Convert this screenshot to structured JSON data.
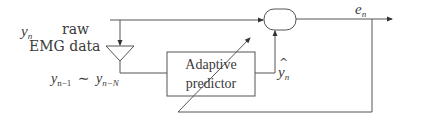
{
  "diagram": {
    "type": "block-diagram",
    "input": {
      "symbol": "y",
      "subscript": "n",
      "description_line1": "raw",
      "description_line2": "EMG data"
    },
    "delay_line_label": {
      "a_symbol": "y",
      "a_subscript": "n−1",
      "tilde": "∼",
      "b_symbol": "y",
      "b_subscript": "n−N"
    },
    "predictor": {
      "line1": "Adaptive",
      "line2": "predictor"
    },
    "prediction": {
      "hat": "^",
      "symbol": "y",
      "subscript": "n"
    },
    "error": {
      "symbol": "e",
      "subscript": "n"
    },
    "colors": {
      "line": "#555555",
      "text": "#3a3a3a",
      "background": "#ffffff"
    }
  }
}
